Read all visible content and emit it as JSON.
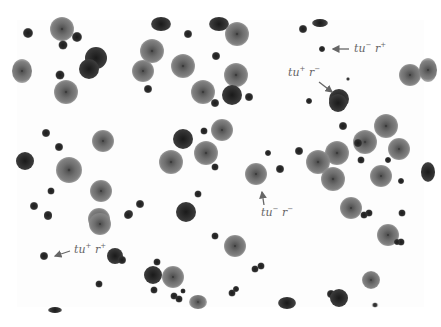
{
  "figure": {
    "labels": [
      {
        "id": "tu-minus-r-plus-top",
        "text": "tu⁻ r⁺",
        "gene1": "tu",
        "sign1": "−",
        "gene2": "r",
        "sign2": "+"
      },
      {
        "id": "tu-plus-r-minus",
        "text": "tu⁺ r⁻",
        "gene1": "tu",
        "sign1": "+",
        "gene2": "r",
        "sign2": "−"
      },
      {
        "id": "tu-minus-r-minus",
        "text": "tu⁻ r⁻",
        "gene1": "tu",
        "sign1": "−",
        "gene2": "r",
        "sign2": "−"
      },
      {
        "id": "tu-plus-r-plus",
        "text": "tu⁺ r⁺",
        "gene1": "tu",
        "sign1": "+",
        "gene2": "r",
        "sign2": "+"
      }
    ],
    "plaque_types": {
      "small": "small dark plaque",
      "tiny": "tiny dark plaque",
      "halo": "large turbid plaque with halo",
      "dark": "large clear dark plaque"
    },
    "colors": {
      "background": "#ffffff",
      "label_text": "#666666",
      "arrow": "#666666"
    }
  }
}
